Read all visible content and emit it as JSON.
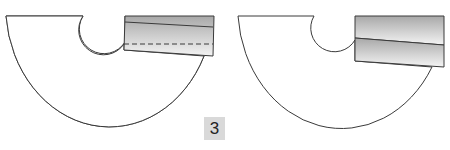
{
  "figure": {
    "step_number": "3",
    "colors": {
      "outline": "#3a3a3a",
      "shape_fill": "#ffffff",
      "band_gradient_dark": "#a8a8a8",
      "band_gradient_light": "#f4f4f4",
      "badge_bg": "#d9d9d9"
    },
    "panels": [
      {
        "name": "left",
        "description": "Semicircular skirt piece with folded waistband showing dashed stitch line"
      },
      {
        "name": "right",
        "description": "Semicircular skirt piece with waistband unfolded into two sections"
      }
    ]
  }
}
